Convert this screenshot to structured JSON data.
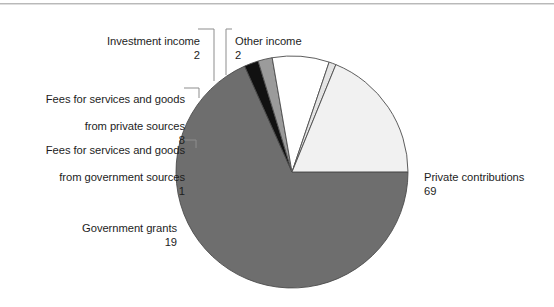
{
  "chart_data": {
    "type": "pie",
    "title": "",
    "subtitle": "",
    "xlabel": "",
    "ylabel": "",
    "legend_position": "none",
    "grid": false,
    "units": "percent",
    "total": 101,
    "categories": [
      "Private contributions",
      "Other income",
      "Investment income",
      "Fees for services and goods from private sources",
      "Fees for services and goods from government sources",
      "Government grants"
    ],
    "values": [
      69,
      2,
      2,
      8,
      1,
      19
    ],
    "slices": [
      {
        "name": "Private contributions",
        "label_line1": "Private contributions",
        "label_line2": "",
        "value": 69,
        "value_text": "69",
        "color": "#6e6e6e",
        "start_angle": 0,
        "sweep_angle": 245.9,
        "leader": false
      },
      {
        "name": "Other income",
        "label_line1": "Other income",
        "label_line2": "",
        "value": 2,
        "value_text": "2",
        "color": "#111111",
        "start_angle": 245.9,
        "sweep_angle": 7.13,
        "leader": true
      },
      {
        "name": "Investment income",
        "label_line1": "Investment income",
        "label_line2": "",
        "value": 2,
        "value_text": "2",
        "color": "#9b9b9b",
        "start_angle": 253.03,
        "sweep_angle": 7.13,
        "leader": true
      },
      {
        "name": "Fees for services and goods from private sources",
        "label_line1": "Fees for services and goods",
        "label_line2": "from private sources",
        "value": 8,
        "value_text": "8",
        "color": "#ffffff",
        "start_angle": 260.16,
        "sweep_angle": 28.51,
        "leader": true
      },
      {
        "name": "Fees for services and goods from government sources",
        "label_line1": "Fees for services and goods",
        "label_line2": "from government sources",
        "value": 1,
        "value_text": "1",
        "color": "#e4e4e4",
        "start_angle": 288.67,
        "sweep_angle": 3.56,
        "leader": true
      },
      {
        "name": "Government grants",
        "label_line1": "Government grants",
        "label_line2": "",
        "value": 19,
        "value_text": "19",
        "color": "#f1f1f1",
        "start_angle": 292.23,
        "sweep_angle": 67.72,
        "leader": false
      }
    ],
    "geometry": {
      "center_x": 292,
      "center_y": 172,
      "radius": 116
    },
    "colors": {
      "outline": "#4c4c4c",
      "leader_line": "#8d8d8d",
      "text": "#1d1d1d",
      "rule": "#b9b9b9",
      "background": "#ffffff"
    }
  },
  "labels": {
    "investment_income": {
      "line1": "Investment income",
      "value": "2"
    },
    "other_income": {
      "line1": "Other income",
      "value": "2"
    },
    "fees_private": {
      "line1": "Fees for services and goods",
      "line2": "from private sources",
      "value": "8"
    },
    "fees_government": {
      "line1": "Fees for services and goods",
      "line2": "from government sources",
      "value": "1"
    },
    "government_grants": {
      "line1": "Government grants",
      "value": "19"
    },
    "private_contributions": {
      "line1": "Private contributions",
      "value": "69"
    }
  }
}
